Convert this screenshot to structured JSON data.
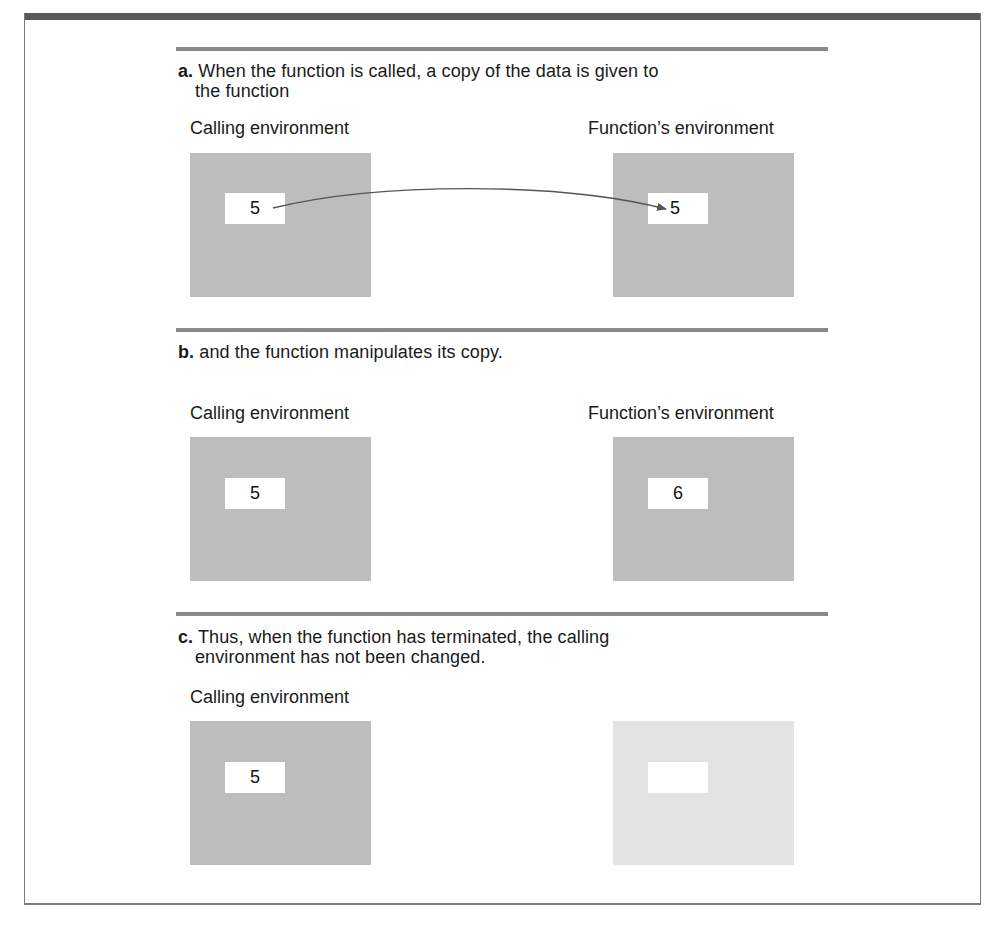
{
  "figure": {
    "colors": {
      "top_bar": "#5a5a5a",
      "divider": "#8a8a8a",
      "env_box": "#bdbdbd",
      "env_box_faded": "#e3e3e3",
      "value_cell": "#ffffff",
      "arrow": "#555555"
    },
    "steps": [
      {
        "marker": "a.",
        "text_line1": " When the function is called, a copy of the data is given to",
        "text_line2": "the function",
        "calling_label": "Calling environment",
        "function_label": "Function’s environment",
        "calling_value": "5",
        "function_value": "5",
        "arrow": "copy-from-calling-to-function"
      },
      {
        "marker": "b.",
        "text_line1": " and the function manipulates its copy.",
        "calling_label": "Calling environment",
        "function_label": "Function’s environment",
        "calling_value": "5",
        "function_value": "6"
      },
      {
        "marker": "c.",
        "text_line1": " Thus, when the function has terminated, the calling",
        "text_line2": "environment has not been changed.",
        "calling_label": "Calling environment",
        "function_label": "",
        "calling_value": "5",
        "function_value": "",
        "function_env_state": "terminated (faded)"
      }
    ]
  }
}
